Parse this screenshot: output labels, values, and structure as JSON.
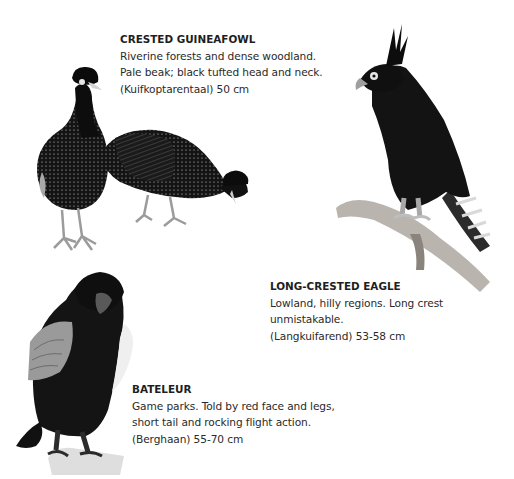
{
  "species": [
    {
      "title": "CRESTED GUINEAFOWL",
      "lines": [
        "Riverine forests and dense woodland.",
        "Pale beak; black tufted head and neck.",
        "(Kuifkoptarentaal) 50 cm"
      ],
      "illustration": "crested-guineafowl-pair-illustration"
    },
    {
      "title": "LONG-CRESTED EAGLE",
      "lines": [
        "Lowland, hilly regions. Long crest",
        "unmistakable.",
        "(Langkuifarend) 53-58 cm"
      ],
      "illustration": "long-crested-eagle-on-branch-illustration"
    },
    {
      "title": "BATELEUR",
      "lines": [
        "Game parks. Told by red face and legs,",
        "short tail and rocking flight action.",
        "(Berghaan) 55-70 cm"
      ],
      "illustration": "bateleur-perched-illustration"
    }
  ],
  "colors": {
    "background": "#ffffff",
    "text": "#2a2a2a",
    "plumage": "#141414",
    "spots": "#d8d8d8",
    "branch": "#b9b4ad",
    "wing_grey": "#9a9a9a"
  }
}
